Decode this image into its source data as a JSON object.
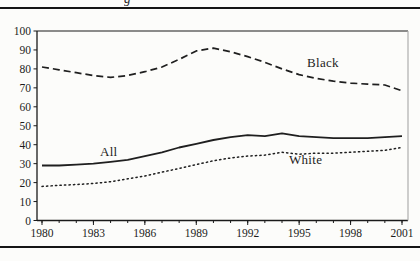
{
  "figure": {
    "cropped_text_fragment": "g",
    "background_color": "#fcfcfa",
    "rule_color": "#151515"
  },
  "chart_data": {
    "type": "line",
    "title": "",
    "xlabel": "",
    "ylabel": "",
    "xlim": [
      1980,
      2001
    ],
    "ylim": [
      0,
      100
    ],
    "grid": false,
    "legend_position": "inline-labels",
    "line_color": "#1f1f1f",
    "plot_border_right_color": "#adadad",
    "y_ticks": [
      100,
      90,
      80,
      70,
      60,
      50,
      40,
      30,
      20,
      10,
      0
    ],
    "x_major_ticks": [
      1980,
      1983,
      1986,
      1989,
      1992,
      1995,
      1998,
      2001
    ],
    "x_minor_step": 1,
    "x": [
      1980,
      1981,
      1982,
      1983,
      1984,
      1985,
      1986,
      1987,
      1988,
      1989,
      1990,
      1991,
      1992,
      1993,
      1994,
      1995,
      1996,
      1997,
      1998,
      1999,
      2000,
      2001
    ],
    "series": [
      {
        "name": "Black",
        "line_style": "dashed",
        "values": [
          81,
          79.5,
          78,
          76.5,
          75.5,
          76.5,
          78.5,
          81,
          85,
          89.5,
          91,
          89,
          86.5,
          83.5,
          80,
          77,
          75,
          73.5,
          72.5,
          72,
          71.5,
          68.5
        ]
      },
      {
        "name": "All",
        "line_style": "solid",
        "values": [
          29,
          29,
          29.5,
          30,
          31,
          32,
          34,
          36,
          38.5,
          40.5,
          42.5,
          44,
          45,
          44.5,
          46,
          44.5,
          44,
          43.5,
          43.5,
          43.5,
          44,
          44.5
        ]
      },
      {
        "name": "White",
        "line_style": "dotted",
        "values": [
          18,
          18.5,
          19,
          19.5,
          20.5,
          22,
          23.5,
          25.5,
          27.5,
          29.5,
          31.5,
          33,
          34,
          34.5,
          36,
          35,
          35.5,
          35.5,
          36,
          36.5,
          37,
          38.5
        ]
      }
    ]
  }
}
